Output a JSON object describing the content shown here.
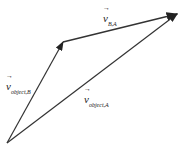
{
  "diagram": {
    "type": "vector-triangle",
    "vectors": [
      {
        "id": "v_object_B",
        "symbol": "v",
        "subscript": "object,B",
        "from": [
          7,
          143
        ],
        "to": [
          63,
          42
        ]
      },
      {
        "id": "v_B_A",
        "symbol": "v",
        "subscript": "B,A",
        "from": [
          63,
          42
        ],
        "to": [
          177,
          14
        ]
      },
      {
        "id": "v_object_A",
        "symbol": "v",
        "subscript": "object,A",
        "from": [
          7,
          143
        ],
        "to": [
          177,
          14
        ]
      }
    ],
    "line_color": "#333333"
  }
}
